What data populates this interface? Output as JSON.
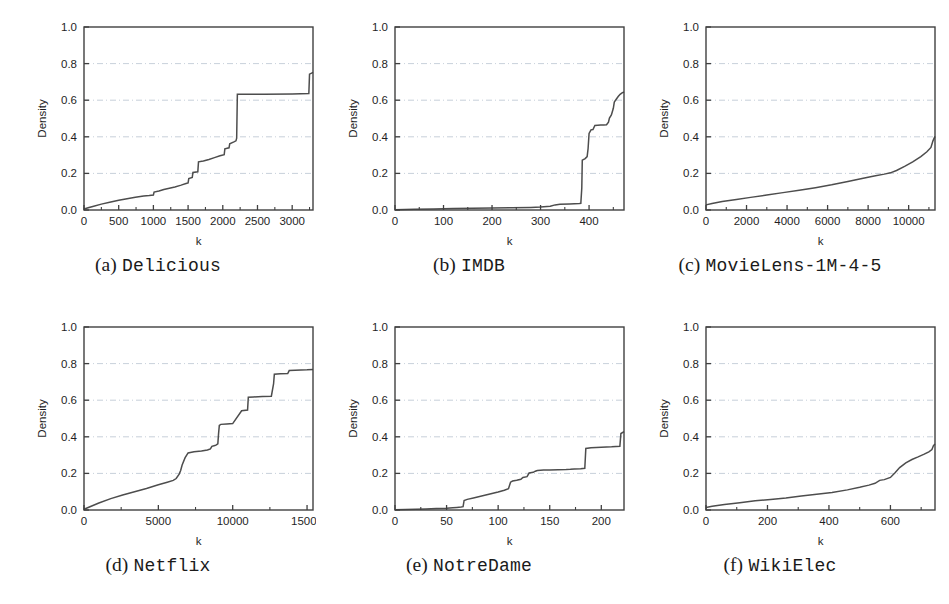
{
  "figure": {
    "background": "#ffffff",
    "line_color": "#4d4d4d",
    "frame_color": "#404040",
    "grid_color": "#b9c4d0",
    "panel_count": 6
  },
  "panels": [
    {
      "id": "a",
      "cap_index": "(a)",
      "cap_name": "Delicious",
      "caption": "(a) Delicious"
    },
    {
      "id": "b",
      "cap_index": "(b)",
      "cap_name": "IMDB",
      "caption": "(b) IMDB"
    },
    {
      "id": "c",
      "cap_index": "(c)",
      "cap_name": "MovieLens-1M-4-5",
      "caption": "(c) MovieLens-1M-4-5"
    },
    {
      "id": "d",
      "cap_index": "(d)",
      "cap_name": "Netflix",
      "caption": "(d) Netflix"
    },
    {
      "id": "e",
      "cap_index": "(e)",
      "cap_name": "NotreDame",
      "caption": "(e) NotreDame"
    },
    {
      "id": "f",
      "cap_index": "(f)",
      "cap_name": "WikiElec",
      "caption": "(f) WikiElec"
    }
  ],
  "chart_data": [
    {
      "type": "line",
      "title": "(a) Delicious",
      "xlabel": "k",
      "ylabel": "Density",
      "xlim": [
        0,
        3300
      ],
      "ylim": [
        0.0,
        1.0
      ],
      "xticks": [
        0,
        500,
        1000,
        1500,
        2000,
        2500,
        3000
      ],
      "xtick_labels": [
        "0",
        "500",
        "1000",
        "1500",
        "2000",
        "2500",
        "3000"
      ],
      "yticks": [
        0.0,
        0.2,
        0.4,
        0.6,
        0.8,
        1.0
      ],
      "ytick_labels": [
        "0.0",
        "0.2",
        "0.4",
        "0.6",
        "0.8",
        "1.0"
      ],
      "grid": "horizontal-dashed",
      "legend": null,
      "x": [
        0,
        60,
        140,
        250,
        370,
        500,
        620,
        740,
        860,
        940,
        1000,
        1010,
        1080,
        1150,
        1230,
        1310,
        1400,
        1470,
        1500,
        1510,
        1560,
        1570,
        1640,
        1650,
        1720,
        1800,
        1880,
        1960,
        2020,
        2030,
        2090,
        2100,
        2160,
        2190,
        2200,
        2210,
        2600,
        3000,
        3240,
        3250,
        3280,
        3300
      ],
      "y": [
        0.005,
        0.012,
        0.021,
        0.032,
        0.042,
        0.053,
        0.062,
        0.07,
        0.076,
        0.079,
        0.082,
        0.098,
        0.104,
        0.112,
        0.119,
        0.126,
        0.136,
        0.145,
        0.148,
        0.172,
        0.178,
        0.205,
        0.209,
        0.263,
        0.268,
        0.276,
        0.286,
        0.296,
        0.302,
        0.334,
        0.34,
        0.362,
        0.372,
        0.378,
        0.392,
        0.632,
        0.633,
        0.634,
        0.636,
        0.742,
        0.748,
        0.752
      ]
    },
    {
      "type": "line",
      "title": "(b) IMDB",
      "xlabel": "k",
      "ylabel": "Density",
      "xlim": [
        0,
        472
      ],
      "ylim": [
        0.0,
        1.0
      ],
      "xticks": [
        0,
        100,
        200,
        300,
        400
      ],
      "xtick_labels": [
        "0",
        "100",
        "200",
        "300",
        "400"
      ],
      "yticks": [
        0.0,
        0.2,
        0.4,
        0.6,
        0.8,
        1.0
      ],
      "ytick_labels": [
        "0.0",
        "0.2",
        "0.4",
        "0.6",
        "0.8",
        "1.0"
      ],
      "grid": "horizontal-dashed",
      "legend": null,
      "x": [
        0,
        40,
        80,
        120,
        160,
        200,
        240,
        280,
        300,
        320,
        330,
        340,
        360,
        370,
        380,
        383,
        385,
        386,
        392,
        396,
        398,
        400,
        404,
        408,
        412,
        418,
        424,
        430,
        436,
        440,
        442,
        446,
        450,
        452,
        456,
        460,
        464,
        468,
        472
      ],
      "y": [
        0.002,
        0.004,
        0.006,
        0.008,
        0.009,
        0.011,
        0.012,
        0.014,
        0.016,
        0.02,
        0.028,
        0.031,
        0.033,
        0.034,
        0.035,
        0.036,
        0.12,
        0.272,
        0.281,
        0.292,
        0.336,
        0.418,
        0.438,
        0.44,
        0.462,
        0.463,
        0.464,
        0.465,
        0.466,
        0.48,
        0.502,
        0.52,
        0.556,
        0.59,
        0.605,
        0.62,
        0.632,
        0.64,
        0.645
      ]
    },
    {
      "type": "line",
      "title": "(c) MovieLens-1M-4-5",
      "xlabel": "k",
      "ylabel": "Density",
      "xlim": [
        0,
        11300
      ],
      "ylim": [
        0.0,
        1.0
      ],
      "xticks": [
        0,
        2000,
        4000,
        6000,
        8000,
        10000
      ],
      "xtick_labels": [
        "0",
        "2000",
        "4000",
        "6000",
        "8000",
        "10000"
      ],
      "yticks": [
        0.0,
        0.2,
        0.4,
        0.6,
        0.8,
        1.0
      ],
      "ytick_labels": [
        "0.0",
        "0.2",
        "0.4",
        "0.6",
        "0.8",
        "1.0"
      ],
      "grid": "horizontal-dashed",
      "legend": null,
      "x": [
        0,
        300,
        800,
        1500,
        2200,
        3000,
        3800,
        4600,
        5400,
        6200,
        7000,
        7700,
        8300,
        8800,
        9100,
        9400,
        9800,
        10200,
        10600,
        10900,
        11100,
        11200,
        11300
      ],
      "y": [
        0.028,
        0.036,
        0.047,
        0.058,
        0.069,
        0.082,
        0.095,
        0.108,
        0.122,
        0.138,
        0.156,
        0.172,
        0.186,
        0.196,
        0.203,
        0.216,
        0.238,
        0.263,
        0.292,
        0.318,
        0.342,
        0.378,
        0.402
      ]
    },
    {
      "type": "line",
      "title": "(d) Netflix",
      "xlabel": "k",
      "ylabel": "Density",
      "xlim": [
        0,
        15400
      ],
      "ylim": [
        0.0,
        1.0
      ],
      "xticks": [
        0,
        5000,
        10000,
        15000
      ],
      "xtick_labels": [
        "0",
        "5000",
        "10000",
        "15000"
      ],
      "yticks": [
        0.0,
        0.2,
        0.4,
        0.6,
        0.8,
        1.0
      ],
      "ytick_labels": [
        "0.0",
        "0.2",
        "0.4",
        "0.6",
        "0.8",
        "1.0"
      ],
      "grid": "horizontal-dashed",
      "legend": null,
      "x": [
        0,
        400,
        1000,
        1800,
        2600,
        3400,
        4200,
        5000,
        5600,
        6000,
        6200,
        6400,
        6500,
        6600,
        6800,
        7000,
        7400,
        7900,
        8300,
        8500,
        8600,
        8800,
        8900,
        9000,
        9050,
        9100,
        9200,
        9600,
        10000,
        10600,
        11000,
        11050,
        11400,
        12000,
        12600,
        12750,
        12800,
        13200,
        13700,
        13800,
        14200,
        15000,
        15400
      ],
      "y": [
        0.004,
        0.018,
        0.038,
        0.062,
        0.082,
        0.1,
        0.118,
        0.138,
        0.152,
        0.162,
        0.172,
        0.196,
        0.216,
        0.246,
        0.286,
        0.312,
        0.318,
        0.322,
        0.328,
        0.334,
        0.348,
        0.352,
        0.356,
        0.362,
        0.418,
        0.462,
        0.468,
        0.47,
        0.472,
        0.542,
        0.546,
        0.616,
        0.618,
        0.62,
        0.622,
        0.69,
        0.742,
        0.744,
        0.746,
        0.762,
        0.764,
        0.766,
        0.768
      ]
    },
    {
      "type": "line",
      "title": "(e) NotreDame",
      "xlabel": "k",
      "ylabel": "Density",
      "xlim": [
        0,
        222
      ],
      "ylim": [
        0.0,
        1.0
      ],
      "xticks": [
        0,
        50,
        100,
        150,
        200
      ],
      "xtick_labels": [
        "0",
        "50",
        "100",
        "150",
        "200"
      ],
      "yticks": [
        0.0,
        0.2,
        0.4,
        0.6,
        0.8,
        1.0
      ],
      "ytick_labels": [
        "0.0",
        "0.2",
        "0.4",
        "0.6",
        "0.8",
        "1.0"
      ],
      "grid": "horizontal-dashed",
      "legend": null,
      "x": [
        0,
        10,
        20,
        30,
        40,
        50,
        56,
        60,
        64,
        66,
        67,
        70,
        76,
        82,
        88,
        94,
        100,
        106,
        110,
        112,
        114,
        118,
        122,
        124,
        128,
        130,
        134,
        136,
        138,
        144,
        150,
        158,
        166,
        170,
        174,
        180,
        184,
        185,
        190,
        200,
        210,
        218,
        219,
        222
      ],
      "y": [
        0.002,
        0.003,
        0.004,
        0.006,
        0.008,
        0.009,
        0.012,
        0.014,
        0.016,
        0.018,
        0.052,
        0.058,
        0.066,
        0.074,
        0.082,
        0.09,
        0.098,
        0.108,
        0.116,
        0.152,
        0.158,
        0.162,
        0.168,
        0.178,
        0.182,
        0.202,
        0.206,
        0.212,
        0.216,
        0.218,
        0.219,
        0.22,
        0.221,
        0.222,
        0.224,
        0.226,
        0.228,
        0.336,
        0.34,
        0.343,
        0.345,
        0.348,
        0.418,
        0.428
      ]
    },
    {
      "type": "line",
      "title": "(f) WikiElec",
      "xlabel": "k",
      "ylabel": "Density",
      "xlim": [
        0,
        745
      ],
      "ylim": [
        0.0,
        1.0
      ],
      "xticks": [
        0,
        200,
        400,
        600
      ],
      "xtick_labels": [
        "0",
        "200",
        "400",
        "600"
      ],
      "yticks": [
        0.0,
        0.2,
        0.4,
        0.6,
        0.8,
        1.0
      ],
      "ytick_labels": [
        "0.0",
        "0.2",
        "0.4",
        "0.6",
        "0.8",
        "1.0"
      ],
      "grid": "horizontal-dashed",
      "legend": null,
      "x": [
        0,
        20,
        60,
        110,
        160,
        210,
        260,
        310,
        360,
        410,
        460,
        500,
        530,
        550,
        565,
        580,
        600,
        615,
        630,
        650,
        670,
        690,
        710,
        725,
        735,
        740,
        745
      ],
      "y": [
        0.014,
        0.02,
        0.03,
        0.04,
        0.05,
        0.058,
        0.066,
        0.076,
        0.086,
        0.096,
        0.11,
        0.124,
        0.136,
        0.146,
        0.162,
        0.166,
        0.178,
        0.204,
        0.232,
        0.258,
        0.276,
        0.29,
        0.305,
        0.318,
        0.33,
        0.352,
        0.36
      ]
    }
  ]
}
